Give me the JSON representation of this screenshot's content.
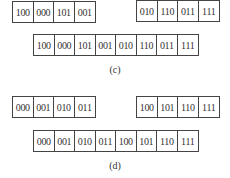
{
  "panels": [
    {
      "label": "(c)",
      "left_block": [
        "100",
        "000",
        "101",
        "001"
      ],
      "right_block": [
        "010",
        "110",
        "011",
        "111"
      ],
      "merged": [
        "100",
        "000",
        "101",
        "001",
        "010",
        "110",
        "011",
        "111"
      ]
    },
    {
      "label": "(d)",
      "left_block": [
        "000",
        "001",
        "010",
        "011"
      ],
      "right_block": [
        "100",
        "101",
        "110",
        "111"
      ],
      "merged": [
        "000",
        "001",
        "010",
        "011",
        "100",
        "101",
        "110",
        "111"
      ]
    }
  ]
}
